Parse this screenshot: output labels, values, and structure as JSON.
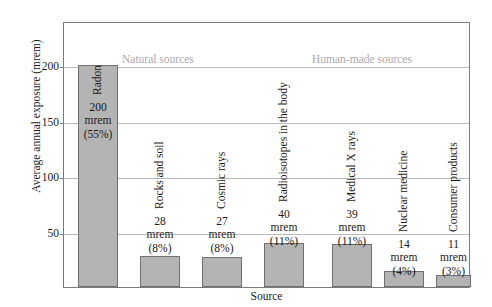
{
  "chart_data": {
    "type": "bar",
    "title": "",
    "xlabel": "Source",
    "ylabel": "Average annual exposure (mrem)",
    "ylim": [
      0,
      240
    ],
    "yticks": [
      50,
      100,
      150,
      200
    ],
    "ytick_labels": [
      "50",
      "100",
      "150",
      "200"
    ],
    "grid": true,
    "legend": "none",
    "categories": [
      "Radon",
      "Rocks and soil",
      "Cosmic rays",
      "Radioisotopes in the body",
      "Medical X rays",
      "Nuclear medicine",
      "Consumer products"
    ],
    "values": [
      200,
      28,
      27,
      40,
      39,
      14,
      11
    ],
    "percentages": [
      "55%",
      "8%",
      "8%",
      "11%",
      "11%",
      "4%",
      "3%"
    ],
    "unit": "mrem",
    "groups": [
      {
        "label": "Natural sources",
        "categories": [
          "Radon",
          "Rocks and soil",
          "Cosmic rays",
          "Radioisotopes in the body"
        ]
      },
      {
        "label": "Human-made sources",
        "categories": [
          "Medical X rays",
          "Nuclear medicine",
          "Consumer products"
        ]
      }
    ],
    "bars": [
      {
        "category": "Radon",
        "value": 200,
        "value_text": "200",
        "unit_text": "mrem",
        "percent_text": "(55%)"
      },
      {
        "category": "Rocks and soil",
        "value": 28,
        "value_text": "28",
        "unit_text": "mrem",
        "percent_text": "(8%)"
      },
      {
        "category": "Cosmic rays",
        "value": 27,
        "value_text": "27",
        "unit_text": "mrem",
        "percent_text": "(8%)"
      },
      {
        "category": "Radioisotopes in the body",
        "value": 40,
        "value_text": "40",
        "unit_text": "mrem",
        "percent_text": "(11%)"
      },
      {
        "category": "Medical X rays",
        "value": 39,
        "value_text": "39",
        "unit_text": "mrem",
        "percent_text": "(11%)"
      },
      {
        "category": "Nuclear medicine",
        "value": 14,
        "value_text": "14",
        "unit_text": "mrem",
        "percent_text": "(4%)"
      },
      {
        "category": "Consumer products",
        "value": 11,
        "value_text": "11",
        "unit_text": "mrem",
        "percent_text": "(3%)"
      }
    ],
    "colors": {
      "bar_fill": "#b4b4b4",
      "bar_border": "#6f6f74",
      "gridline": "#b9b9bd",
      "frame": "#7a7a80",
      "group_label": "#a9a9ad",
      "text": "#1a1a1a",
      "background": "#ffffff"
    }
  }
}
